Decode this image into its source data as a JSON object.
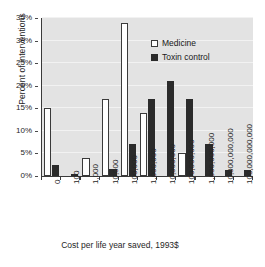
{
  "chart_data": {
    "type": "bar",
    "title": "",
    "xlabel": "Cost per life year saved, 1993$",
    "ylabel": "Percent of interventions",
    "categories": [
      "0",
      "100",
      "1,000",
      "10,000",
      "100,000",
      "1,000,000",
      "10,000,000",
      "100,000,000",
      "1,000,000,000",
      "10,000,000,000",
      "100,000,000,000"
    ],
    "series": [
      {
        "name": "Medicine",
        "color": "#ffffff",
        "edge_color": "#3a3a3a",
        "values": [
          15,
          0,
          4,
          17,
          34,
          14,
          0,
          5,
          0,
          0,
          0
        ]
      },
      {
        "name": "Toxin control",
        "color": "#2b2b2b",
        "edge_color": "#2b2b2b",
        "values": [
          2.5,
          0.3,
          0,
          1.5,
          7,
          17,
          21,
          17,
          7,
          1.3,
          1.3
        ]
      }
    ],
    "ylim": [
      0,
      35
    ],
    "yticks": [
      "0%",
      "5%",
      "10%",
      "15%",
      "20%",
      "25%",
      "30%",
      "35%"
    ],
    "ytick_values": [
      0,
      5,
      10,
      15,
      20,
      25,
      30,
      35
    ],
    "grid": true,
    "legend_position": "upper-center-right",
    "plot_background": "#e3e3e3",
    "grid_color": "#f2f2f2"
  },
  "legend": {
    "items": [
      {
        "label": "Medicine",
        "marker": "open-square"
      },
      {
        "label": "Toxin control",
        "marker": "filled-square"
      }
    ]
  }
}
